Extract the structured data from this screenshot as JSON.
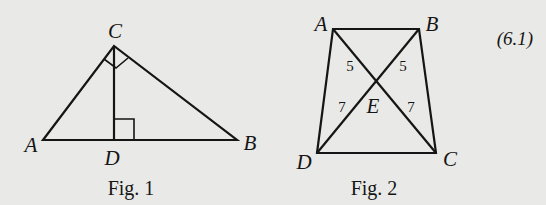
{
  "equation_number": "(6.1)",
  "fig1": {
    "caption": "Fig. 1",
    "labels": {
      "A": "A",
      "B": "B",
      "C": "C",
      "D": "D"
    },
    "right_angles": [
      "ACB",
      "CDB"
    ]
  },
  "fig2": {
    "caption": "Fig. 2",
    "labels": {
      "A": "A",
      "B": "B",
      "C": "C",
      "D": "D",
      "E": "E"
    },
    "segments": {
      "AE": "5",
      "BE": "5",
      "DE": "7",
      "CE": "7"
    }
  },
  "colors": {
    "ink": "#151515",
    "paper": "#e9e9e7"
  }
}
